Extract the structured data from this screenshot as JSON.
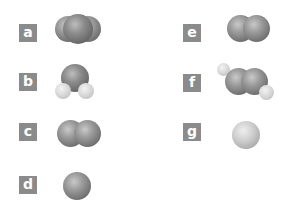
{
  "items": [
    {
      "label": "a",
      "molecule": "triatomic-linear",
      "description": "three fused dark spheres (linear triatomic)"
    },
    {
      "label": "b",
      "molecule": "bent-triatomic",
      "description": "one large sphere with two small light spheres (bent, water-like)"
    },
    {
      "label": "c",
      "molecule": "diatomic",
      "description": "two fused spheres"
    },
    {
      "label": "d",
      "molecule": "monatomic",
      "description": "single dark sphere"
    },
    {
      "label": "e",
      "molecule": "diatomic",
      "description": "two fused spheres"
    },
    {
      "label": "f",
      "molecule": "linear-tetraatomic",
      "description": "two large spheres with two small light spheres on ends (tilted)"
    },
    {
      "label": "g",
      "molecule": "monatomic",
      "description": "single light sphere"
    }
  ],
  "colors": {
    "label_bg": "#8b8b8b",
    "label_text": "#ffffff",
    "atom_dark": "#7a7a7a",
    "atom_light": "#cfcfcf"
  }
}
